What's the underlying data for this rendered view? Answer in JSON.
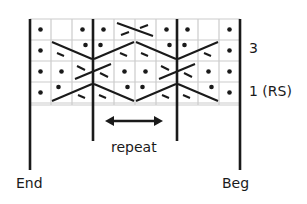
{
  "diagram": {
    "type": "knitting-chart",
    "columns": 10,
    "rows": 4,
    "cell_size": 21,
    "grid_color": "#cccccc",
    "ink_color": "#1a1a1a",
    "row_labels": [
      {
        "row": 3,
        "text": "3"
      },
      {
        "row": 1,
        "text": "1 (RS)"
      }
    ],
    "bottom_labels": {
      "end": "End",
      "beg": "Beg",
      "repeat": "repeat"
    },
    "repeat_columns": [
      4,
      7
    ],
    "grid_rows_top_to_bottom": [
      {
        "row": 4,
        "cells": [
          "dot",
          "",
          "dot",
          "dot",
          "cable-left",
          "cable-left",
          "dot",
          "dot",
          "",
          "dot"
        ]
      },
      {
        "row": 3,
        "cells": [
          "dot",
          "travel-right",
          "travel-right-dot",
          "travel-left-dot",
          "travel-left",
          "travel-right",
          "travel-right-dot",
          "travel-left-dot",
          "travel-left",
          "dot"
        ]
      },
      {
        "row": 2,
        "cells": [
          "dot",
          "dot",
          "cross",
          "cross",
          "dot",
          "dot",
          "cross",
          "cross",
          "dot",
          "dot"
        ]
      },
      {
        "row": 1,
        "cells": [
          "dot",
          "travel-left-dot",
          "travel-left",
          "travel-right",
          "travel-right-dot",
          "travel-left-dot",
          "travel-left",
          "travel-right",
          "travel-right-dot",
          "dot"
        ]
      }
    ]
  }
}
